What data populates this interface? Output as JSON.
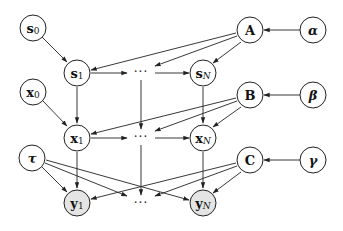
{
  "diagram": {
    "type": "probabilistic-graphical-model",
    "nodes": {
      "s0": {
        "main": "s",
        "sub": "0",
        "observed": false
      },
      "s1": {
        "main": "s",
        "sub": "1",
        "observed": false
      },
      "sN": {
        "main": "s",
        "sub": "N",
        "observed": false
      },
      "x0": {
        "main": "x",
        "sub": "0",
        "observed": false
      },
      "x1": {
        "main": "x",
        "sub": "1",
        "observed": false
      },
      "xN": {
        "main": "x",
        "sub": "N",
        "observed": false
      },
      "y1": {
        "main": "y",
        "sub": "1",
        "observed": true
      },
      "yN": {
        "main": "y",
        "sub": "N",
        "observed": true
      },
      "A": {
        "main": "A",
        "sub": "",
        "observed": false
      },
      "B": {
        "main": "B",
        "sub": "",
        "observed": false
      },
      "C": {
        "main": "C",
        "sub": "",
        "observed": false
      },
      "alpha": {
        "main": "α",
        "sub": "",
        "observed": false
      },
      "beta": {
        "main": "β",
        "sub": "",
        "observed": false
      },
      "gamma": {
        "main": "γ",
        "sub": "",
        "observed": false
      },
      "tau": {
        "main": "τ",
        "sub": "",
        "observed": false
      }
    },
    "ellipsis": {
      "s_row": "···",
      "x_row": "···",
      "y_row": "···"
    },
    "edges": [
      [
        "s0",
        "s1"
      ],
      [
        "s1",
        "s_dots"
      ],
      [
        "s_dots",
        "sN"
      ],
      [
        "x0",
        "x1"
      ],
      [
        "x1",
        "x_dots"
      ],
      [
        "x_dots",
        "xN"
      ],
      [
        "s1",
        "x1"
      ],
      [
        "s_dots",
        "x_dots"
      ],
      [
        "sN",
        "xN"
      ],
      [
        "x1",
        "y1"
      ],
      [
        "x_dots",
        "y_dots"
      ],
      [
        "xN",
        "yN"
      ],
      [
        "A",
        "s1"
      ],
      [
        "A",
        "s_dots"
      ],
      [
        "A",
        "sN"
      ],
      [
        "B",
        "x1"
      ],
      [
        "B",
        "x_dots"
      ],
      [
        "B",
        "xN"
      ],
      [
        "C",
        "y1"
      ],
      [
        "C",
        "y_dots"
      ],
      [
        "C",
        "yN"
      ],
      [
        "tau",
        "y1"
      ],
      [
        "tau",
        "y_dots"
      ],
      [
        "tau",
        "yN"
      ],
      [
        "alpha",
        "A"
      ],
      [
        "beta",
        "B"
      ],
      [
        "gamma",
        "C"
      ]
    ]
  }
}
